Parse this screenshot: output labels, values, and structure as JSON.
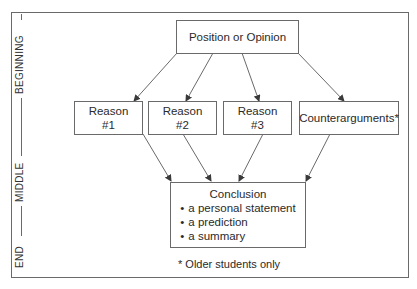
{
  "title_cut": "Figure   ·   Proposition/Argument Paragraph Organizer",
  "side_labels": {
    "beginning": "BEGINNING",
    "middle": "MIDDLE",
    "end": "END"
  },
  "nodes": {
    "position": "Position or Opinion",
    "reasons": [
      {
        "line1": "Reason",
        "line2": "#1"
      },
      {
        "line1": "Reason",
        "line2": "#2"
      },
      {
        "line1": "Reason",
        "line2": "#3"
      }
    ],
    "counterarguments": "Counterarguments*",
    "conclusion": {
      "title": "Conclusion",
      "items": [
        "a personal statement",
        "a prediction",
        "a summary"
      ]
    }
  },
  "footnote": "* Older students only",
  "colors": {
    "line": "#6a6a6a",
    "text": "#2a2a2a",
    "background": "#ffffff"
  }
}
